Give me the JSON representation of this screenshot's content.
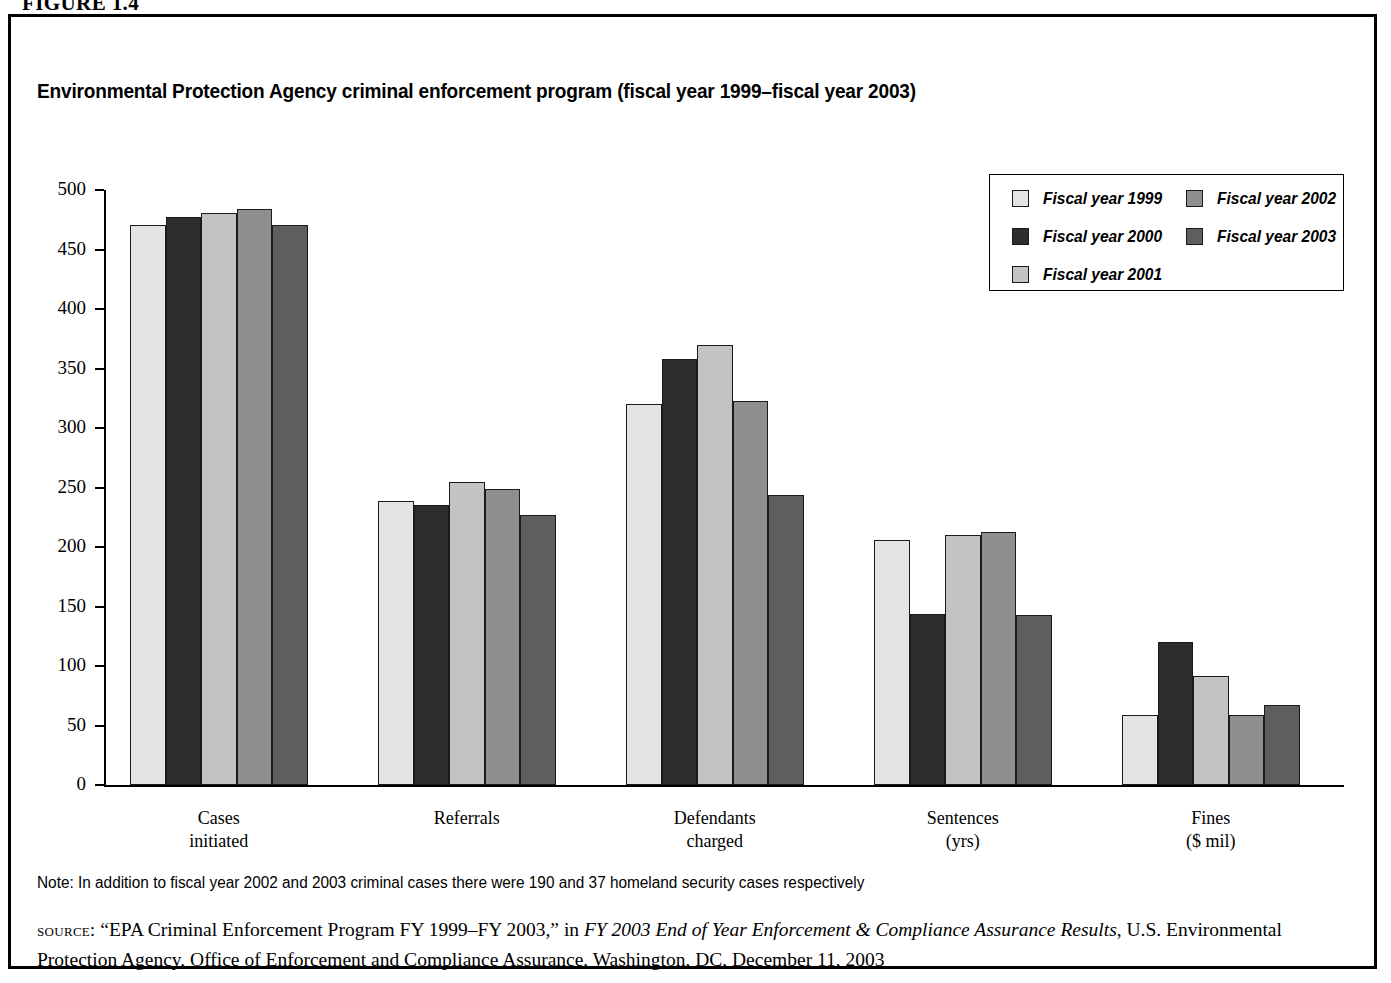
{
  "figure": {
    "label": "FIGURE 1.4"
  },
  "chart_title": "Environmental Protection Agency criminal enforcement program (fiscal year 1999–fiscal year 2003)",
  "legend": {
    "entries": [
      {
        "label": "Fiscal year 1999",
        "color": "#e3e3e3",
        "swatch_name": "legend-swatch-fy1999"
      },
      {
        "label": "Fiscal year  2000",
        "color": "#2e2e2e",
        "swatch_name": "legend-swatch-fy2000"
      },
      {
        "label": "Fiscal year 2001",
        "color": "#c3c3c3",
        "swatch_name": "legend-swatch-fy2001"
      },
      {
        "label": "Fiscal year 2002",
        "color": "#8f8f8f",
        "swatch_name": "legend-swatch-fy2002"
      },
      {
        "label": "Fiscal year 2003",
        "color": "#5e5e5e",
        "swatch_name": "legend-swatch-fy2003"
      }
    ]
  },
  "note": "Note: In addition to fiscal year 2002 and 2003 criminal cases there were 190 and 37 homeland security cases respectively",
  "source": {
    "label": "source:",
    "part1": " “EPA Criminal Enforcement Program FY 1999–FY 2003,” in ",
    "italic1": "FY 2003 End of Year Enforcement & Compliance Assurance Results",
    "part2": ", U.S. Environmental Protection Agency, Office of Enforcement and Compliance Assurance, Washington, DC, December 11, 2003"
  },
  "chart_data": {
    "type": "bar",
    "title": "Environmental Protection Agency criminal enforcement program (fiscal year 1999–fiscal year 2003)",
    "xlabel": "",
    "ylabel": "",
    "ylim": [
      0,
      500
    ],
    "yticks": [
      0,
      50,
      100,
      150,
      200,
      250,
      300,
      350,
      400,
      450,
      500
    ],
    "grid": false,
    "legend_position": "top-right",
    "categories": [
      "Cases\ninitiated",
      "Referrals",
      "Defendants\ncharged",
      "Sentences\n(yrs)",
      "Fines\n($ mil)"
    ],
    "series": [
      {
        "name": "Fiscal year 1999",
        "color": "#e3e3e3",
        "values": [
          471,
          239,
          320,
          206,
          59
        ]
      },
      {
        "name": "Fiscal year  2000",
        "color": "#2e2e2e",
        "values": [
          477,
          235,
          358,
          144,
          120
        ]
      },
      {
        "name": "Fiscal year 2001",
        "color": "#c3c3c3",
        "values": [
          481,
          255,
          370,
          210,
          92
        ]
      },
      {
        "name": "Fiscal year 2002",
        "color": "#8f8f8f",
        "values": [
          484,
          249,
          323,
          213,
          59
        ]
      },
      {
        "name": "Fiscal year 2003",
        "color": "#5e5e5e",
        "values": [
          471,
          227,
          244,
          143,
          67
        ]
      }
    ]
  }
}
